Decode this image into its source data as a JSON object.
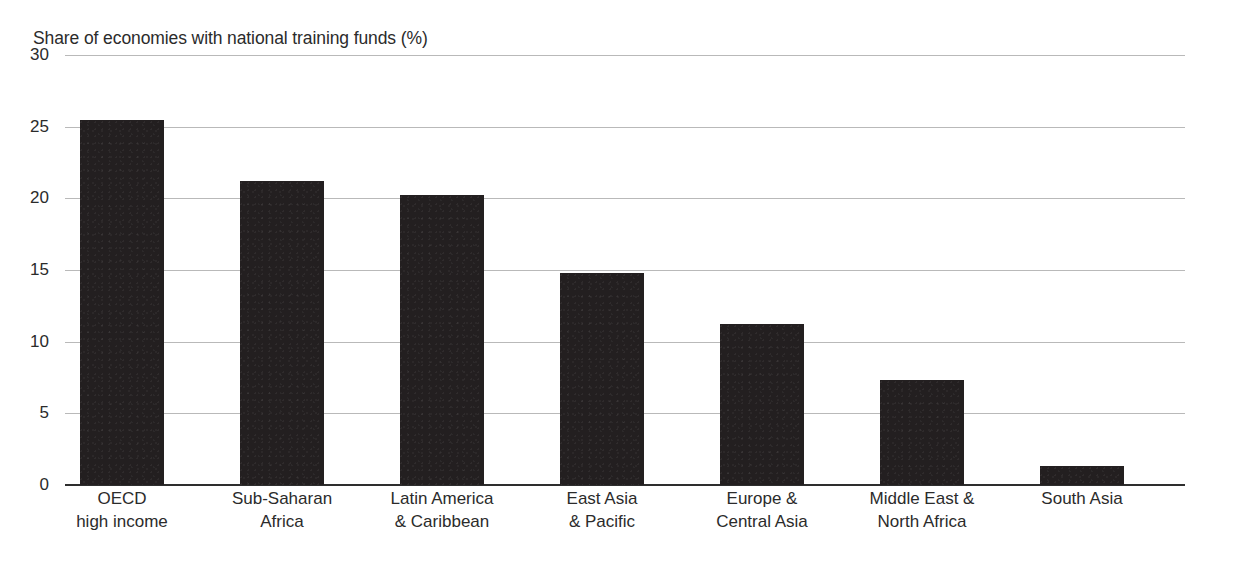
{
  "chart_data": {
    "type": "bar",
    "title": "Share of economies with national training funds (%)",
    "subtitle": "",
    "xlabel": "",
    "ylabel": "Share of economies with national training funds (%)",
    "categories": [
      "OECD high income",
      "Sub-Saharan Africa",
      "Latin America & Caribbean",
      "East Asia & Pacific",
      "Europe & Central Asia",
      "Middle East & North Africa",
      "South Asia"
    ],
    "category_lines": [
      [
        "OECD",
        "high income"
      ],
      [
        "Sub-Saharan",
        "Africa"
      ],
      [
        "Latin America",
        "& Caribbean"
      ],
      [
        "East Asia",
        "& Pacific"
      ],
      [
        "Europe &",
        "Central Asia"
      ],
      [
        "Middle East &",
        "North Africa"
      ],
      [
        "South Asia",
        ""
      ]
    ],
    "values": [
      25.5,
      21.2,
      20.2,
      14.8,
      11.2,
      7.3,
      1.3
    ],
    "ylim": [
      0,
      30
    ],
    "yticks": [
      0,
      5,
      10,
      15,
      20,
      25,
      30
    ],
    "ytick_labels": [
      "0",
      "5",
      "10",
      "15",
      "20",
      "25",
      "30"
    ],
    "grid": true,
    "grid_axis": "y",
    "legend": "none",
    "bar_color": "#231f20",
    "gridline_color": "#b9b9b9",
    "axis_color": "#2e2e2e",
    "background_color": "#ffffff",
    "text_color": "#2b2b2b"
  }
}
